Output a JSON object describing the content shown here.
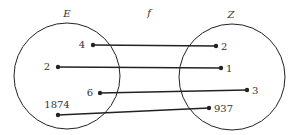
{
  "diagram": {
    "function_label": "f",
    "domain": {
      "label": "E",
      "elements": [
        {
          "value": "4",
          "x": 93,
          "y": 45,
          "lx": 85,
          "ly": 48,
          "anchor": "end"
        },
        {
          "value": "2",
          "x": 58,
          "y": 67,
          "lx": 50,
          "ly": 70,
          "anchor": "end"
        },
        {
          "value": "6",
          "x": 100,
          "y": 93,
          "lx": 93,
          "ly": 96,
          "anchor": "end"
        },
        {
          "value": "1874",
          "x": 58,
          "y": 115,
          "lx": 57,
          "ly": 108,
          "anchor": "middle"
        }
      ]
    },
    "codomain": {
      "label": "Z",
      "elements": [
        {
          "value": "2",
          "x": 216,
          "y": 46
        },
        {
          "value": "1",
          "x": 221,
          "y": 68
        },
        {
          "value": "3",
          "x": 247,
          "y": 90
        },
        {
          "value": "937",
          "x": 209,
          "y": 108
        }
      ]
    },
    "mapping": [
      {
        "from": "4",
        "to": "2"
      },
      {
        "from": "2",
        "to": "1"
      },
      {
        "from": "6",
        "to": "3"
      },
      {
        "from": "1874",
        "to": "937"
      }
    ],
    "colors": {
      "stroke": "#222222",
      "text": "#333333"
    }
  }
}
